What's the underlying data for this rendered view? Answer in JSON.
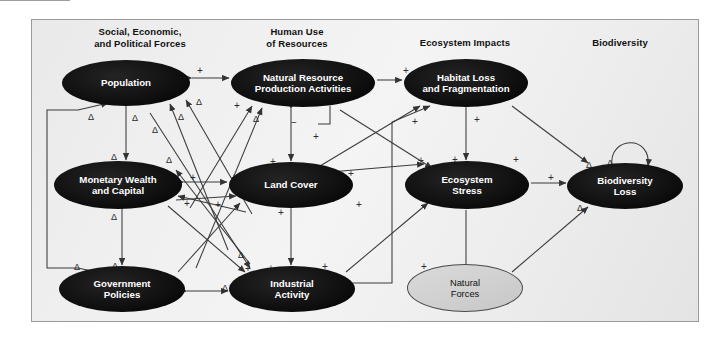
{
  "figure": {
    "frame": {
      "border_color": "#9a9a9a",
      "background": "#eeeeee"
    }
  },
  "columns": [
    {
      "id": "col-social",
      "label": "Social, Economic,\nand Political Forces",
      "line1": "Social, Economic,",
      "line2": "and Political Forces",
      "x": 60,
      "y": 26,
      "w": 160
    },
    {
      "id": "col-humanuse",
      "label": "Human Use\nof Resources",
      "line1": "Human Use",
      "line2": "of Resources",
      "x": 232,
      "y": 26,
      "w": 130
    },
    {
      "id": "col-ecosystem",
      "label": "Ecosystem Impacts",
      "line1": "Ecosystem Impacts",
      "line2": "",
      "x": 395,
      "y": 37,
      "w": 140
    },
    {
      "id": "col-biodiv",
      "label": "Biodiversity",
      "line1": "Biodiversity",
      "line2": "",
      "x": 555,
      "y": 37,
      "w": 130
    }
  ],
  "nodes": [
    {
      "id": "population",
      "label": "Population",
      "line1": "Population",
      "line2": "",
      "style": "dark",
      "cx": 126,
      "cy": 83,
      "rx": 64,
      "ry": 23
    },
    {
      "id": "natural-resource-production",
      "label": "Natural Resource Production Activities",
      "line1": "Natural Resource",
      "line2": "Production Activities",
      "style": "dark",
      "cx": 303,
      "cy": 83,
      "rx": 72,
      "ry": 24
    },
    {
      "id": "habitat-loss",
      "label": "Habitat Loss and Fragmentation",
      "line1": "Habitat Loss",
      "line2": "and Fragmentation",
      "style": "dark",
      "cx": 466,
      "cy": 83,
      "rx": 62,
      "ry": 24
    },
    {
      "id": "monetary-wealth",
      "label": "Monetary Wealth and Capital",
      "line1": "Monetary Wealth",
      "line2": "and Capital",
      "style": "dark",
      "cx": 118,
      "cy": 185,
      "rx": 64,
      "ry": 24
    },
    {
      "id": "land-cover",
      "label": "Land Cover",
      "line1": "Land Cover",
      "line2": "",
      "style": "dark",
      "cx": 291,
      "cy": 185,
      "rx": 62,
      "ry": 23
    },
    {
      "id": "ecosystem-stress",
      "label": "Ecosystem Stress",
      "line1": "Ecosystem",
      "line2": "Stress",
      "style": "dark",
      "cx": 467,
      "cy": 185,
      "rx": 62,
      "ry": 24
    },
    {
      "id": "biodiversity-loss",
      "label": "Biodiversity Loss",
      "line1": "Biodiversity",
      "line2": "Loss",
      "style": "dark",
      "cx": 625,
      "cy": 186,
      "rx": 58,
      "ry": 23
    },
    {
      "id": "government-policies",
      "label": "Government Policies",
      "line1": "Government",
      "line2": "Policies",
      "style": "dark",
      "cx": 122,
      "cy": 289,
      "rx": 63,
      "ry": 23
    },
    {
      "id": "industrial-activity",
      "label": "Industrial Activity",
      "line1": "Industrial",
      "line2": "Activity",
      "style": "dark",
      "cx": 292,
      "cy": 289,
      "rx": 63,
      "ry": 23
    },
    {
      "id": "natural-forces",
      "label": "Natural Forces",
      "line1": "Natural",
      "line2": "Forces",
      "style": "light",
      "cx": 465,
      "cy": 288,
      "rx": 58,
      "ry": 24
    }
  ],
  "edge_sign_labels": [
    {
      "id": "s1",
      "text": "+",
      "x": 197,
      "y": 66
    },
    {
      "id": "s2",
      "text": "+",
      "x": 262,
      "y": 66
    },
    {
      "id": "s3",
      "text": "Δ",
      "x": 88,
      "y": 112
    },
    {
      "id": "s4",
      "text": "Δ",
      "x": 132,
      "y": 113
    },
    {
      "id": "s5",
      "text": "Δ",
      "x": 178,
      "y": 112
    },
    {
      "id": "s6",
      "text": "Δ",
      "x": 196,
      "y": 97
    },
    {
      "id": "s7",
      "text": "Δ",
      "x": 152,
      "y": 125
    },
    {
      "id": "s8",
      "text": "+",
      "x": 234,
      "y": 101
    },
    {
      "id": "s9",
      "text": "Δ",
      "x": 253,
      "y": 114
    },
    {
      "id": "s10",
      "text": "−",
      "x": 291,
      "y": 118
    },
    {
      "id": "s11",
      "text": "+",
      "x": 313,
      "y": 132
    },
    {
      "id": "s12",
      "text": "+",
      "x": 403,
      "y": 66
    },
    {
      "id": "s13",
      "text": "+",
      "x": 412,
      "y": 117
    },
    {
      "id": "s14",
      "text": "+",
      "x": 474,
      "y": 115
    },
    {
      "id": "s15",
      "text": "Δ",
      "x": 111,
      "y": 152
    },
    {
      "id": "s16",
      "text": "Δ",
      "x": 166,
      "y": 155
    },
    {
      "id": "s17",
      "text": "+",
      "x": 190,
      "y": 173
    },
    {
      "id": "s18",
      "text": "+",
      "x": 231,
      "y": 173
    },
    {
      "id": "s19",
      "text": "+",
      "x": 184,
      "y": 199
    },
    {
      "id": "s20",
      "text": "+",
      "x": 215,
      "y": 200
    },
    {
      "id": "s21",
      "text": "Δ",
      "x": 253,
      "y": 172
    },
    {
      "id": "s22",
      "text": "+",
      "x": 270,
      "y": 157
    },
    {
      "id": "s23",
      "text": "+",
      "x": 348,
      "y": 169
    },
    {
      "id": "s24",
      "text": "+",
      "x": 356,
      "y": 200
    },
    {
      "id": "s25",
      "text": "+",
      "x": 418,
      "y": 156
    },
    {
      "id": "s26",
      "text": "+",
      "x": 452,
      "y": 155
    },
    {
      "id": "s27",
      "text": "+",
      "x": 548,
      "y": 173
    },
    {
      "id": "s28",
      "text": "Δ",
      "x": 586,
      "y": 160
    },
    {
      "id": "s29",
      "text": "Δ",
      "x": 607,
      "y": 158
    },
    {
      "id": "s30",
      "text": "Δ",
      "x": 577,
      "y": 203
    },
    {
      "id": "s31",
      "text": "Δ",
      "x": 111,
      "y": 212
    },
    {
      "id": "s32",
      "text": "+",
      "x": 278,
      "y": 208
    },
    {
      "id": "s33",
      "text": "Δ",
      "x": 74,
      "y": 262
    },
    {
      "id": "s34",
      "text": "Δ",
      "x": 112,
      "y": 261
    },
    {
      "id": "s35",
      "text": "Δ",
      "x": 222,
      "y": 283
    },
    {
      "id": "s36",
      "text": "+",
      "x": 245,
      "y": 264
    },
    {
      "id": "s37",
      "text": "+",
      "x": 268,
      "y": 264
    },
    {
      "id": "s38",
      "text": "+",
      "x": 322,
      "y": 262
    },
    {
      "id": "s39",
      "text": "+",
      "x": 421,
      "y": 262
    },
    {
      "id": "s40",
      "text": "Δ",
      "x": 238,
      "y": 250
    },
    {
      "id": "s41",
      "text": "+",
      "x": 513,
      "y": 155
    }
  ],
  "legend_notes": {
    "plus_meaning": "+",
    "minus_meaning": "−",
    "delta_meaning": "Δ"
  }
}
